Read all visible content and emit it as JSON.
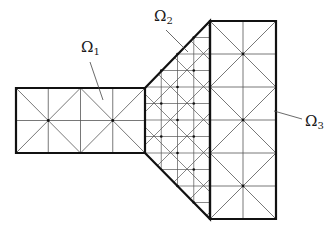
{
  "figure": {
    "type": "domain decomposition mesh",
    "subdomains": [
      {
        "id": "omega1",
        "symbol": "Ω",
        "subscript": "1",
        "description": "left rectangle, coarse mesh"
      },
      {
        "id": "omega2",
        "symbol": "Ω",
        "subscript": "2",
        "description": "middle trapezoid, fine mesh"
      },
      {
        "id": "omega3",
        "symbol": "Ω",
        "subscript": "3",
        "description": "right tall rectangle, coarse mesh"
      }
    ]
  },
  "colors": {
    "boundary": "#111111",
    "mesh": "#555555",
    "leader": "#444444",
    "background": "#ffffff"
  }
}
